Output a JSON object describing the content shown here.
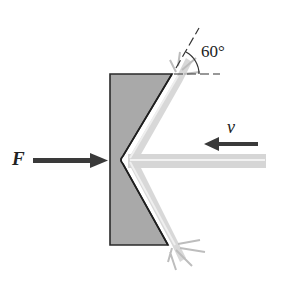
{
  "diagram": {
    "labels": {
      "force": "F",
      "velocity": "v",
      "angle": "60°"
    },
    "colors": {
      "block_fill": "#a9a9a9",
      "block_edge": "#2a2a2a",
      "jet": "#cfcfcf",
      "arrow": "#3a3a3a"
    },
    "elements": [
      {
        "id": "block",
        "type": "shaded-block-with-v-notch"
      },
      {
        "id": "jet",
        "type": "incoming-water-jet",
        "direction": "leftward"
      },
      {
        "id": "deflected-jets",
        "type": "split-jet",
        "angle_deg": 60
      },
      {
        "id": "force-arrow",
        "label": "F",
        "direction": "rightward"
      },
      {
        "id": "velocity-arrow",
        "label": "v",
        "direction": "leftward"
      },
      {
        "id": "angle-marker",
        "label": "60°"
      }
    ]
  }
}
